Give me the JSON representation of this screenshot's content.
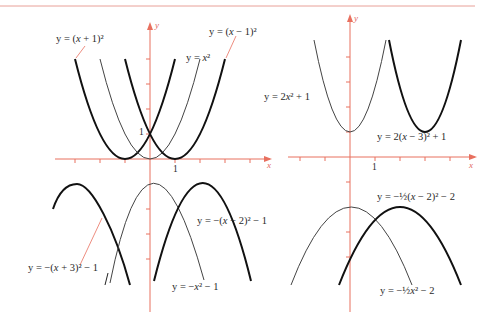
{
  "figure": {
    "type": "parabola transformations",
    "colors": {
      "axis": "#e8705f",
      "curve": "#1a1a1a",
      "curve_light": "#4a4a4a",
      "rule": "#e8a098"
    },
    "panels": [
      {
        "id": "top-left",
        "axis_labels": {
          "x": "x",
          "y": "y"
        },
        "tick_labels": {
          "x": "1",
          "y": "1"
        },
        "curves": [
          {
            "label": "y = (x + 1)²",
            "equation": "y=(x+1)^2",
            "weight": "bold"
          },
          {
            "label": "y = x²",
            "equation": "y=x^2",
            "weight": "thin"
          },
          {
            "label": "y = (x − 1)²",
            "equation": "y=(x-1)^2",
            "weight": "bold"
          }
        ]
      },
      {
        "id": "top-right",
        "axis_labels": {
          "x": "x",
          "y": "y"
        },
        "tick_labels": {
          "x": "1"
        },
        "curves": [
          {
            "label": "y = 2x² + 1",
            "equation": "y=2x^2+1",
            "weight": "thin"
          },
          {
            "label": "y = 2(x − 3)² + 1",
            "equation": "y=2(x-3)^2+1",
            "weight": "bold"
          }
        ]
      },
      {
        "id": "bottom-left",
        "curves": [
          {
            "label": "y = −(x + 3)² − 1",
            "equation": "y=-(x+3)^2-1",
            "weight": "bold"
          },
          {
            "label": "y = −x² − 1",
            "equation": "y=-x^2-1",
            "weight": "thin"
          },
          {
            "label": "y = −(x − 2)² − 1",
            "equation": "y=-(x-2)^2-1",
            "weight": "bold"
          }
        ]
      },
      {
        "id": "bottom-right",
        "curves": [
          {
            "label": "y = −½(x − 2)² − 2",
            "equation": "y=-1/2(x-2)^2-2",
            "weight": "bold"
          },
          {
            "label": "y = −½x² − 2",
            "equation": "y=-1/2x^2-2",
            "weight": "thin"
          }
        ]
      }
    ]
  },
  "labels": {
    "tl_a": {
      "pre": "y = (",
      "var": "x",
      "post": " + 1)²"
    },
    "tl_b": {
      "pre": "y = ",
      "var": "x",
      "post": "²"
    },
    "tl_c": {
      "pre": "y = (",
      "var": "x",
      "post": " − 1)²"
    },
    "tr_a": {
      "pre": "y = 2",
      "var": "x",
      "post": "² + 1"
    },
    "tr_b": {
      "pre": "y = 2(",
      "var": "x",
      "post": " − 3)² + 1"
    },
    "bl_a": {
      "pre": "y = −(",
      "var": "x",
      "post": " + 3)² − 1"
    },
    "bl_b": {
      "pre": "y = −",
      "var": "x",
      "post": "² − 1"
    },
    "bl_c": {
      "pre": "y = −(",
      "var": "x",
      "post": " − 2)² − 1"
    },
    "br_a": {
      "pre": "y = −½(",
      "var": "x",
      "post": " − 2)² − 2"
    },
    "br_b": {
      "pre": "y = −½",
      "var": "x",
      "post": "² − 2"
    }
  },
  "axes": {
    "x": "x",
    "y": "y",
    "one": "1"
  }
}
